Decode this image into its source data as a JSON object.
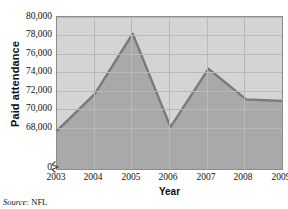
{
  "chart_data": {
    "type": "area",
    "title": "",
    "xlabel": "Year",
    "ylabel": "Paid attendance",
    "categories": [
      "2003",
      "2004",
      "2005",
      "2006",
      "2007",
      "2008",
      "2009"
    ],
    "values": [
      67700,
      71700,
      78200,
      68100,
      74400,
      71100,
      70900
    ],
    "series": [
      {
        "name": "Paid attendance",
        "values": [
          67700,
          71700,
          78200,
          68100,
          74400,
          71100,
          70900
        ]
      }
    ],
    "ylim": [
      67000,
      80000
    ],
    "y_ticks": [
      "0",
      "68,000",
      "70,000",
      "72,000",
      "74,000",
      "76,000",
      "78,000",
      "80,000"
    ],
    "y_tick_values": [
      67000,
      68000,
      70000,
      72000,
      74000,
      76000,
      78000,
      80000
    ],
    "x_ticks": [
      "2003",
      "2004",
      "2005",
      "2006",
      "2007",
      "2008",
      "2009"
    ],
    "grid": true,
    "legend": "none",
    "axis_break": true,
    "colors": {
      "area_fill": "#a9a9a9",
      "line": "#7a7a7a",
      "plot_background": "#d4d4d4",
      "gridline": "#b9b9b9",
      "axis": "#555555",
      "text": "#111111"
    }
  },
  "source": {
    "label": "Source:",
    "value": "NFL"
  }
}
